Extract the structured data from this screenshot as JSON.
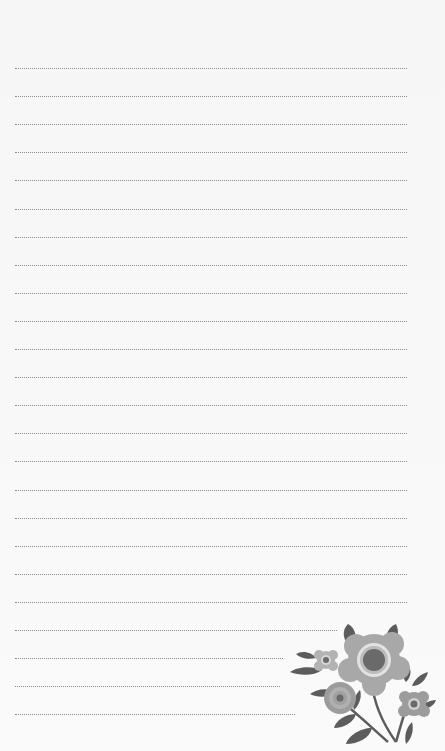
{
  "document": {
    "type": "lined-notepaper",
    "line_count": 24,
    "line_start_y": 68,
    "line_spacing": 28.1,
    "line_color": "#8c8c8c",
    "background_color": "#f7f7f7",
    "lines": [
      {
        "end_x": 407
      },
      {
        "end_x": 407
      },
      {
        "end_x": 407
      },
      {
        "end_x": 407
      },
      {
        "end_x": 407
      },
      {
        "end_x": 407
      },
      {
        "end_x": 407
      },
      {
        "end_x": 407
      },
      {
        "end_x": 407
      },
      {
        "end_x": 407
      },
      {
        "end_x": 407
      },
      {
        "end_x": 407
      },
      {
        "end_x": 407
      },
      {
        "end_x": 407
      },
      {
        "end_x": 407
      },
      {
        "end_x": 407
      },
      {
        "end_x": 407
      },
      {
        "end_x": 407
      },
      {
        "end_x": 407
      },
      {
        "end_x": 407
      },
      {
        "end_x": 337
      },
      {
        "end_x": 283
      },
      {
        "end_x": 280
      },
      {
        "end_x": 295
      }
    ]
  },
  "decoration": {
    "icon": "flower-bouquet-icon",
    "colors": {
      "petal_light": "#b3b3b3",
      "petal_mid": "#a0a0a0",
      "center": "#6a6a6a",
      "leaf": "#5c5c5c",
      "ring": "#e0e0e0"
    }
  }
}
